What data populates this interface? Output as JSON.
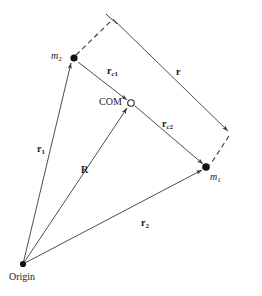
{
  "figure": {
    "background_color": "#ffffff",
    "line_color": "#3a3a3a",
    "text_color": "#1a1a1a",
    "width": 262,
    "height": 296
  },
  "points": {
    "origin": {
      "label": "Origin",
      "x": 23,
      "y": 264,
      "marker": "filled-dot"
    },
    "m2": {
      "label": "m",
      "subscript": "2",
      "x": 73,
      "y": 58,
      "marker": "filled-dot"
    },
    "m1": {
      "label": "m",
      "subscript": "1",
      "x": 206,
      "y": 167,
      "marker": "filled-dot"
    },
    "com": {
      "label": "COM",
      "x": 130,
      "y": 103,
      "marker": "open-circle"
    },
    "corner_top": {
      "x": 113,
      "y": 19,
      "marker": "tick"
    },
    "corner_right": {
      "x": 230,
      "y": 133,
      "marker": "arrowhead"
    }
  },
  "vectors": {
    "r1": {
      "label": "r",
      "subscript": "1",
      "from": "origin",
      "to": "m2",
      "style": "solid",
      "arrow": true
    },
    "r2": {
      "label": "r",
      "subscript": "2",
      "from": "origin",
      "to": "m1",
      "style": "solid",
      "arrow": true
    },
    "R": {
      "label": "R",
      "subscript": "",
      "from": "origin",
      "to": "com",
      "style": "solid",
      "arrow": true
    },
    "rc1": {
      "label": "r",
      "subscript": "c1",
      "from": "m2",
      "to": "com",
      "style": "solid",
      "arrow": true
    },
    "rc2": {
      "label": "r",
      "subscript": "c2",
      "from": "com",
      "to": "m1",
      "style": "solid",
      "arrow": true
    },
    "r": {
      "label": "r",
      "subscript": "",
      "from": "corner_top",
      "to": "corner_right",
      "style": "solid",
      "arrow": true
    }
  },
  "construction_lines": [
    {
      "name": "dashed-m2-to-top-corner",
      "style": "dashed"
    },
    {
      "name": "dashed-right-corner-to-m1",
      "style": "dashed"
    }
  ],
  "labels": {
    "origin": "Origin",
    "com": "COM",
    "m1_base": "m",
    "m1_sub": "1",
    "m2_base": "m",
    "m2_sub": "2",
    "r1_base": "r",
    "r1_sub": "1",
    "r2_base": "r",
    "r2_sub": "2",
    "R": "R",
    "rc1_base": "r",
    "rc1_sub_it": "c",
    "rc1_sub_num": "1",
    "rc2_base": "r",
    "rc2_sub_it": "c",
    "rc2_sub_num": "2",
    "r_sep": "r"
  }
}
